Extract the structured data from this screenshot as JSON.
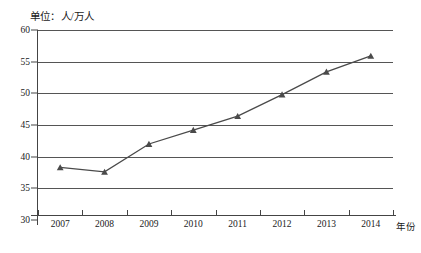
{
  "chart_data": {
    "type": "line",
    "title": "",
    "unit_note": "单位：人/万人",
    "xlabel": "年份",
    "ylabel": "",
    "categories": [
      "2007",
      "2008",
      "2009",
      "2010",
      "2011",
      "2012",
      "2013",
      "2014"
    ],
    "values": [
      38.3,
      37.6,
      42.0,
      44.2,
      46.4,
      49.8,
      53.4,
      55.9
    ],
    "series": [
      {
        "name": "人数",
        "values": [
          38.3,
          37.6,
          42.0,
          44.2,
          46.4,
          49.8,
          53.4,
          55.9
        ]
      }
    ],
    "ylim": [
      30,
      60
    ],
    "yticks": [
      30,
      35,
      40,
      45,
      50,
      55,
      60
    ],
    "ytick_labels": [
      "30",
      "35",
      "40",
      "45",
      "50",
      "55",
      "60"
    ],
    "xtick_labels": [
      "2007",
      "2008",
      "2009",
      "2010",
      "2011",
      "2012",
      "2013",
      "2014"
    ],
    "grid": true,
    "grid_axis": "y",
    "legend": false,
    "legend_position": "none",
    "marker": "triangle",
    "line_color": "#4a4a4a",
    "marker_color": "#4a4a4a",
    "grid_color": "#555555",
    "axis_color": "#444444",
    "background_color": "#ffffff"
  }
}
